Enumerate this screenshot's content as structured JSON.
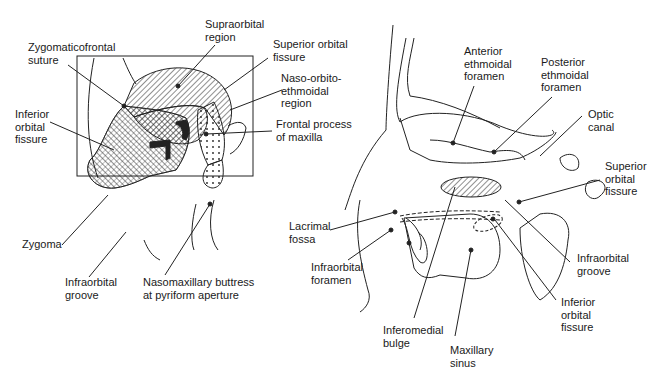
{
  "left_panel": {
    "labels": [
      {
        "id": "supraorbital-region",
        "text": "Supraorbital\nregion",
        "x": 205,
        "y": 18
      },
      {
        "id": "zygomaticofrontal-suture",
        "text": "Zygomaticofrontal\nsuture",
        "x": 28,
        "y": 41
      },
      {
        "id": "superior-orbital-fissure",
        "text": "Superior orbital\nfissure",
        "x": 273,
        "y": 38
      },
      {
        "id": "naso-orbito-ethmoidal-region",
        "text": "Naso-orbito-\nethmoidal\nregion",
        "x": 281,
        "y": 72
      },
      {
        "id": "inferior-orbital-fissure",
        "text": "Inferior\norbital\nfissure",
        "x": 15,
        "y": 108
      },
      {
        "id": "frontal-process-of-maxilla",
        "text": "Frontal process\nof maxilla",
        "x": 276,
        "y": 118
      },
      {
        "id": "zygoma",
        "text": "Zygoma",
        "x": 22,
        "y": 238
      },
      {
        "id": "infraorbital-groove",
        "text": "Infraorbital\ngroove",
        "x": 65,
        "y": 276
      },
      {
        "id": "nasomaxillary-buttress",
        "text": "Nasomaxillary buttress\nat pyriform aperture",
        "x": 143,
        "y": 276
      }
    ]
  },
  "right_panel": {
    "labels": [
      {
        "id": "anterior-ethmoidal-foramen",
        "text": "Anterior\nethmoidal\nforamen",
        "x": 464,
        "y": 45
      },
      {
        "id": "posterior-ethmoidal-foramen",
        "text": "Posterior\nethmoidal\nforamen",
        "x": 541,
        "y": 56
      },
      {
        "id": "optic-canal",
        "text": "Optic\ncanal",
        "x": 588,
        "y": 108
      },
      {
        "id": "superior-orbital-fissure-r",
        "text": "Superior\norbital\nfissure",
        "x": 605,
        "y": 160
      },
      {
        "id": "lacrimal-fossa",
        "text": "Lacrimal\nfossa",
        "x": 289,
        "y": 220
      },
      {
        "id": "infraorbital-foramen",
        "text": "Infraorbital\nforamen",
        "x": 311,
        "y": 261
      },
      {
        "id": "infraorbital-groove-r",
        "text": "Infraorbital\ngroove",
        "x": 577,
        "y": 252
      },
      {
        "id": "inferior-orbital-fissure-r",
        "text": "Inferior\norbital\nfissure",
        "x": 561,
        "y": 296
      },
      {
        "id": "inferomedial-bulge",
        "text": "Inferomedial\nbulge",
        "x": 383,
        "y": 324
      },
      {
        "id": "maxillary-sinus",
        "text": "Maxillary\nsinus",
        "x": 450,
        "y": 344
      }
    ]
  }
}
